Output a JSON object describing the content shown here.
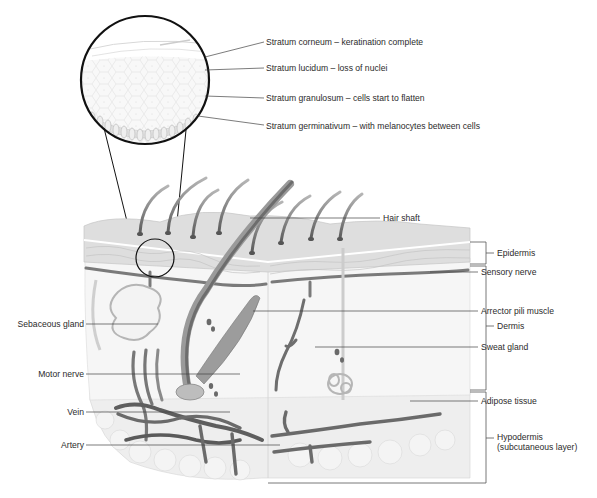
{
  "diagram": {
    "magnified_view": {
      "labels": [
        "Stratum corneum – keratination complete",
        "Stratum lucidum – loss of nuclei",
        "Stratum granulosum – cells start to flatten",
        "Stratum germinativum – with melanocytes between cells"
      ]
    },
    "right_labels": {
      "hair_shaft": "Hair shaft",
      "sensory_nerve": "Sensory nerve",
      "arrector_pili": "Arrector pili muscle",
      "sweat_gland": "Sweat gland",
      "adipose": "Adipose tissue"
    },
    "left_labels": {
      "sebaceous": "Sebaceous gland",
      "motor_nerve": "Motor nerve",
      "vein": "Vein",
      "artery": "Artery"
    },
    "layers": {
      "epidermis": "Epidermis",
      "dermis": "Dermis",
      "hypodermis_line1": "Hypodermis",
      "hypodermis_line2": "(subcutaneous layer)"
    },
    "colors": {
      "line": "#333333",
      "skin_light": "#e8e8e8",
      "skin_mid": "#cfcfcf",
      "vessel": "#6a6a6a",
      "hair": "#777777"
    }
  }
}
